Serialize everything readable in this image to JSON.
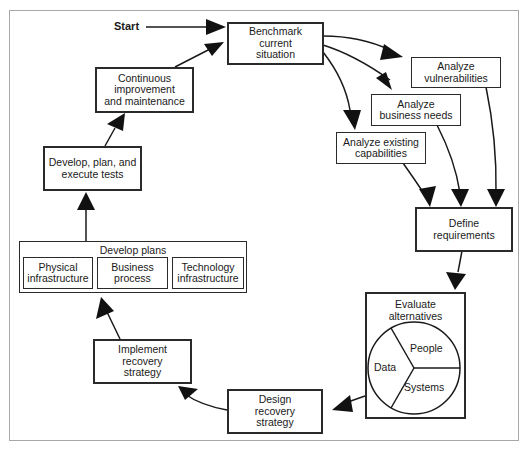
{
  "diagram": {
    "start_label": "Start",
    "nodes": {
      "benchmark": "Benchmark\ncurrent\nsituation",
      "vulnerabilities": "Analyze\nvulnerabilities",
      "business_needs": "Analyze\nbusiness needs",
      "existing_capabilities": "Analyze existing\ncapabilities",
      "define_requirements": "Define\nrequirements",
      "evaluate_alternatives": "Evaluate\nalternatives",
      "design_strategy": "Design\nrecovery\nstrategy",
      "implement_strategy": "Implement\nrecovery\nstrategy",
      "develop_plans": "Develop plans",
      "develop_tests": "Develop, plan, and\nexecute tests",
      "continuous_improvement": "Continuous\nimprovement\nand maintenance"
    },
    "plan_parts": [
      "Physical\ninfrastructure",
      "Business\nprocess",
      "Technology\ninfrastructure"
    ],
    "alternatives_pie": {
      "segments": [
        "Data",
        "People",
        "Systems"
      ]
    },
    "edges": [
      [
        "Start",
        "Benchmark current situation"
      ],
      [
        "Benchmark current situation",
        "Analyze vulnerabilities"
      ],
      [
        "Benchmark current situation",
        "Analyze business needs"
      ],
      [
        "Benchmark current situation",
        "Analyze existing capabilities"
      ],
      [
        "Analyze existing capabilities",
        "Define requirements"
      ],
      [
        "Analyze business needs",
        "Define requirements"
      ],
      [
        "Analyze vulnerabilities",
        "Define requirements"
      ],
      [
        "Define requirements",
        "Evaluate alternatives"
      ],
      [
        "Evaluate alternatives",
        "Design recovery strategy"
      ],
      [
        "Design recovery strategy",
        "Implement recovery strategy"
      ],
      [
        "Implement recovery strategy",
        "Develop plans"
      ],
      [
        "Develop plans",
        "Develop, plan, and execute tests"
      ],
      [
        "Develop, plan, and execute tests",
        "Continuous improvement and maintenance"
      ],
      [
        "Continuous improvement and maintenance",
        "Benchmark current situation"
      ]
    ]
  }
}
